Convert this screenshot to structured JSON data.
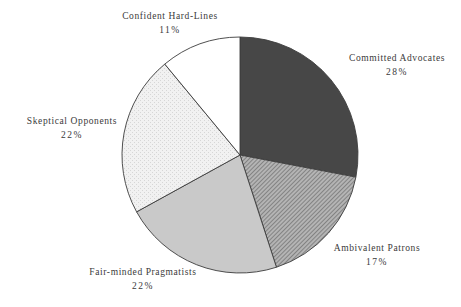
{
  "chart_data": {
    "type": "pie",
    "title": "",
    "start_angle_deg": 0,
    "direction": "clockwise",
    "slices": [
      {
        "label": "Committed Advocates",
        "value": 28,
        "pct_label": "28%",
        "fill": "#474747",
        "pattern": "solid"
      },
      {
        "label": "Ambivalent Patrons",
        "value": 17,
        "pct_label": "17%",
        "fill": "#9a9a9a",
        "pattern": "diagonal-hatch"
      },
      {
        "label": "Fair-minded Pragmatists",
        "value": 22,
        "pct_label": "22%",
        "fill": "#c9c9c9",
        "pattern": "solid"
      },
      {
        "label": "Skeptical Opponents",
        "value": 22,
        "pct_label": "22%",
        "fill": "#ededed",
        "pattern": "dotted"
      },
      {
        "label": "Confident Hard-Lines",
        "value": 11,
        "pct_label": "11%",
        "fill": "#ffffff",
        "pattern": "solid"
      }
    ],
    "legend": "none",
    "labels_position": "outside"
  },
  "labels": {
    "committed": {
      "name": "Committed Advocates",
      "pct": "28%"
    },
    "ambivalent": {
      "name": "Ambivalent Patrons",
      "pct": "17%"
    },
    "fairminded": {
      "name": "Fair-minded Pragmatists",
      "pct": "22%"
    },
    "skeptical": {
      "name": "Skeptical Opponents",
      "pct": "22%"
    },
    "confident": {
      "name": "Confident Hard-Lines",
      "pct": "11%"
    }
  }
}
